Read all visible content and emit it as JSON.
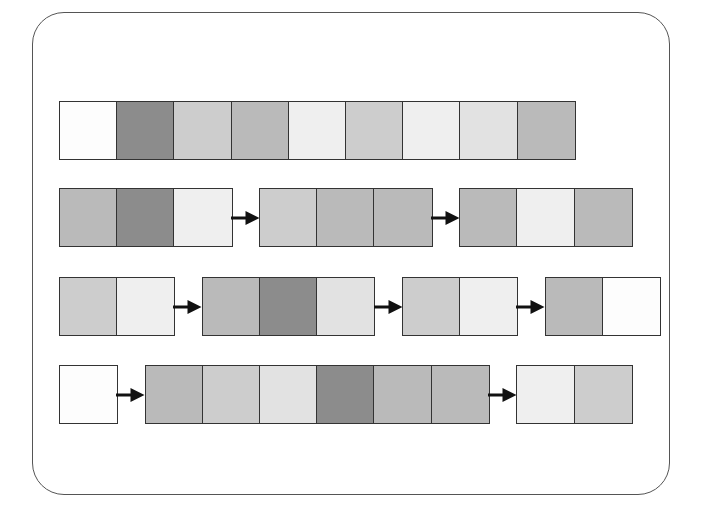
{
  "palette": {
    "white": "#fdfdfd",
    "very_light": "#efefef",
    "light": "#e2e2e2",
    "light_medium": "#cdcdcd",
    "medium": "#bababa",
    "dark": "#8c8c8c"
  },
  "rows": [
    {
      "name": "row-1",
      "groups": [
        {
          "cells": [
            "white",
            "dark",
            "light_medium",
            "medium",
            "very_light",
            "light_medium",
            "very_light",
            "light",
            "medium"
          ]
        }
      ]
    },
    {
      "name": "row-2",
      "groups": [
        {
          "cells": [
            "medium",
            "dark",
            "very_light"
          ]
        },
        {
          "cells": [
            "light_medium",
            "medium",
            "medium"
          ]
        },
        {
          "cells": [
            "medium",
            "very_light",
            "medium"
          ]
        }
      ]
    },
    {
      "name": "row-3",
      "groups": [
        {
          "cells": [
            "light_medium",
            "very_light"
          ]
        },
        {
          "cells": [
            "medium",
            "dark",
            "light"
          ]
        },
        {
          "cells": [
            "light_medium",
            "very_light"
          ]
        },
        {
          "cells": [
            "medium",
            "white"
          ]
        }
      ]
    },
    {
      "name": "row-4",
      "groups": [
        {
          "cells": [
            "white"
          ]
        },
        {
          "cells": [
            "medium",
            "light_medium",
            "light",
            "dark",
            "medium",
            "medium"
          ]
        },
        {
          "cells": [
            "very_light",
            "light_medium"
          ]
        }
      ]
    }
  ],
  "arrow_color": "#111111",
  "border_color": "#333333"
}
